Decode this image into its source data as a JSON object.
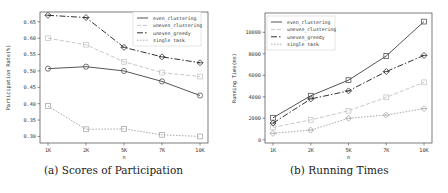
{
  "chart_data": [
    {
      "type": "line",
      "title": "",
      "caption": "(a) Scores of Participation",
      "xlabel": "n",
      "ylabel": "Participation Rate(%)",
      "categories": [
        "1K",
        "2K",
        "5K",
        "7K",
        "10K"
      ],
      "ylim": [
        0.28,
        0.68
      ],
      "yticks": [
        0.3,
        0.35,
        0.4,
        0.45,
        0.5,
        0.55,
        0.6,
        0.65
      ],
      "ytick_labels": [
        "0.30",
        "0.35",
        "0.40",
        "0.45",
        "0.50",
        "0.55",
        "0.60",
        "0.65"
      ],
      "grid": false,
      "legend_position": "upper right",
      "series": [
        {
          "name": "even_clustering",
          "values": [
            0.507,
            0.513,
            0.5,
            0.468,
            0.425
          ],
          "color": "#555555",
          "dash": "",
          "marker": "circle"
        },
        {
          "name": "uneven_clustering",
          "values": [
            0.6,
            0.58,
            0.528,
            0.495,
            0.483
          ],
          "color": "#c8c8c8",
          "dash": "4,2",
          "marker": "square"
        },
        {
          "name": "uneven_greedy",
          "values": [
            0.67,
            0.663,
            0.572,
            0.543,
            0.525
          ],
          "color": "#333333",
          "dash": "6,2,1.5,2",
          "marker": "diamond"
        },
        {
          "name": "single task",
          "values": [
            0.393,
            0.322,
            0.323,
            0.305,
            0.3
          ],
          "color": "#aaaaaa",
          "dash": "1.5,1.5",
          "marker": "square"
        }
      ]
    },
    {
      "type": "line",
      "title": "",
      "caption": "(b) Running Times",
      "xlabel": "n",
      "ylabel": "Running Time(ms)",
      "categories": [
        "1K",
        "2K",
        "5K",
        "7K",
        "10K"
      ],
      "ylim": [
        -300,
        11800
      ],
      "yticks": [
        0,
        2000,
        4000,
        6000,
        8000,
        10000
      ],
      "ytick_labels": [
        "0",
        "2000",
        "4000",
        "6000",
        "8000",
        "10000"
      ],
      "grid": false,
      "legend_position": "upper left",
      "series": [
        {
          "name": "even_clustering",
          "values": [
            2050,
            4100,
            5550,
            7800,
            11000
          ],
          "color": "#555555",
          "dash": "",
          "marker": "square"
        },
        {
          "name": "uneven_clustering",
          "values": [
            1150,
            1850,
            2700,
            3950,
            5350
          ],
          "color": "#c8c8c8",
          "dash": "4,2",
          "marker": "square"
        },
        {
          "name": "uneven_greedy",
          "values": [
            1550,
            3800,
            4550,
            6350,
            7850
          ],
          "color": "#333333",
          "dash": "6,2,1.5,2",
          "marker": "diamond"
        },
        {
          "name": "single task",
          "values": [
            600,
            900,
            2000,
            2300,
            2900
          ],
          "color": "#aaaaaa",
          "dash": "1.5,1.5",
          "marker": "diamond"
        }
      ]
    }
  ],
  "captions": {
    "a": "(a) Scores of Participation",
    "b": "(b) Running Times"
  }
}
